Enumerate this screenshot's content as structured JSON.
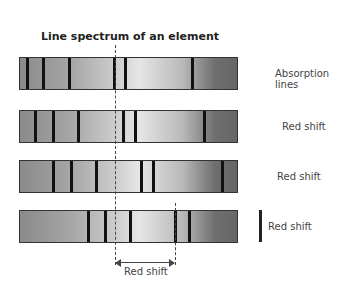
{
  "title": "Line spectrum of an element",
  "bands": [
    {
      "label": "Absorption lines",
      "top": 57,
      "lines": [
        27,
        43,
        69,
        114,
        125,
        192
      ]
    },
    {
      "label": "Red shift",
      "top": 110,
      "lines": [
        35,
        53,
        78,
        123,
        135,
        204
      ]
    },
    {
      "label": "Red shift",
      "top": 160,
      "lines": [
        53,
        71,
        96,
        141,
        153,
        222
      ]
    },
    {
      "label": "Red shift",
      "top": 210,
      "lines": [
        88,
        105,
        130,
        175,
        189
      ]
    }
  ],
  "annotation": {
    "label": "Red shift",
    "from_x": 115,
    "to_x": 175
  },
  "colors": {
    "line": "#111111",
    "border": "#333333",
    "text": "#444444"
  }
}
